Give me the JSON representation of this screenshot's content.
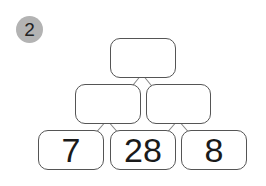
{
  "problem": {
    "number": "2",
    "badge_color": "#b3b3b3",
    "border_color": "#555555"
  },
  "pyramid": {
    "top": [
      {
        "value": ""
      }
    ],
    "middle": [
      {
        "value": ""
      },
      {
        "value": ""
      }
    ],
    "bottom": [
      {
        "value": "7"
      },
      {
        "value": "28"
      },
      {
        "value": "8"
      }
    ]
  }
}
